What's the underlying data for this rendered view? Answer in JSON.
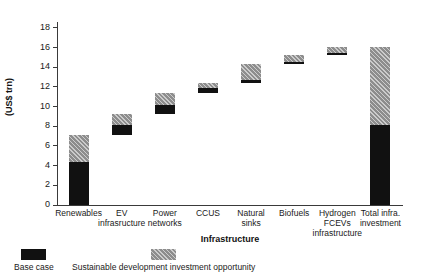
{
  "chart_data": {
    "type": "bar",
    "subtype": "waterfall-stacked",
    "title": "",
    "xlabel": "Infrastructure",
    "ylabel": "(US$ trn)",
    "ylim": [
      0,
      18.6
    ],
    "yticks": [
      0,
      2,
      4,
      6,
      8,
      10,
      12,
      14,
      16,
      18
    ],
    "ytick_labels": [
      "0",
      "2",
      "4",
      "6",
      "8",
      "10",
      "12",
      "14",
      "16",
      "18"
    ],
    "grid": false,
    "legend_position": "bottom-left",
    "categories": [
      "Renewables",
      "EV\ninfrasructure",
      "Power\nnetworks",
      "CCUS",
      "Natural\nsinks",
      "Biofuels",
      "Hydrogen\nFCEVs\ninfrastructure",
      "Total infra.\ninvestment"
    ],
    "series": [
      {
        "name": "Base case",
        "color": "#111111",
        "values": [
          4.35,
          1.0,
          1.0,
          0.45,
          0.3,
          0.2,
          0.2,
          8.1
        ]
      },
      {
        "name": "Sustainable development investment opportunity",
        "color": "#8d8d8d",
        "values": [
          2.75,
          1.1,
          1.2,
          0.55,
          1.6,
          0.7,
          0.7,
          8.0
        ]
      }
    ],
    "bars": [
      {
        "category": "Renewables",
        "bottom": 0.0,
        "base_top": 4.35,
        "top": 7.1
      },
      {
        "category": "EV infrasructure",
        "bottom": 7.1,
        "base_top": 8.1,
        "top": 9.2
      },
      {
        "category": "Power networks",
        "bottom": 9.2,
        "base_top": 10.2,
        "top": 11.4
      },
      {
        "category": "CCUS",
        "bottom": 11.4,
        "base_top": 11.85,
        "top": 12.4
      },
      {
        "category": "Natural sinks",
        "bottom": 12.4,
        "base_top": 12.7,
        "top": 14.3
      },
      {
        "category": "Biofuels",
        "bottom": 14.3,
        "base_top": 14.5,
        "top": 15.2
      },
      {
        "category": "Hydrogen FCEVs infrastructure",
        "bottom": 15.2,
        "base_top": 15.4,
        "top": 16.1
      },
      {
        "category": "Total infra. investment",
        "bottom": 0.0,
        "base_top": 8.1,
        "top": 16.1
      }
    ]
  },
  "legend": {
    "items": [
      {
        "label": "Base case",
        "swatch": "base"
      },
      {
        "label": "Sustainable development investment opportunity",
        "swatch": "opp"
      }
    ]
  }
}
